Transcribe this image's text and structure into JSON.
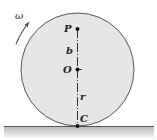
{
  "diagram": {
    "type": "rolling-disk",
    "labels": {
      "omega": "ω",
      "point_p": "P",
      "distance_b": "b",
      "center_o": "O",
      "radius_r": "r",
      "contact_c": "C"
    },
    "colors": {
      "disk_fill": "#e6e6e6",
      "disk_stroke": "#555555",
      "ground_line": "#555555",
      "ground_shade": "#bdbdbd",
      "point": "#111111"
    }
  }
}
